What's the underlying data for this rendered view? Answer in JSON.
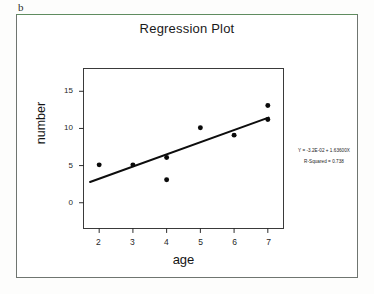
{
  "figure": {
    "panel_letter": "b"
  },
  "chart_data": {
    "type": "scatter",
    "title": "Regression Plot",
    "xlabel": "age",
    "ylabel": "number",
    "x": [
      2,
      3,
      4,
      4,
      5,
      6,
      7,
      7
    ],
    "y": [
      5.1,
      5.1,
      6.1,
      3.1,
      10.1,
      9.1,
      13.1,
      11.2
    ],
    "points": [
      {
        "x": 2,
        "y": 5.1
      },
      {
        "x": 3,
        "y": 5.1
      },
      {
        "x": 4,
        "y": 6.1
      },
      {
        "x": 4,
        "y": 3.1
      },
      {
        "x": 5,
        "y": 10.1
      },
      {
        "x": 6,
        "y": 9.1
      },
      {
        "x": 7,
        "y": 13.1
      },
      {
        "x": 7,
        "y": 11.2
      }
    ],
    "xlim": [
      1.55,
      7.45
    ],
    "ylim": [
      -3.4,
      18.0
    ],
    "xticks": [
      2,
      3,
      4,
      5,
      6,
      7
    ],
    "xtick_labels": [
      "2",
      "3",
      "4",
      "5",
      "6",
      "7"
    ],
    "yticks": [
      0,
      5,
      10,
      15
    ],
    "ytick_labels": [
      "0",
      "5",
      "10",
      "15"
    ],
    "grid": false,
    "legend": "none",
    "fit_line": {
      "intercept": -0.032,
      "slope": 1.636,
      "x_start": 1.73,
      "x_end": 7.02
    },
    "annotations": [
      "Y = -3.2E-02 + 1.63600X",
      "R-Squared = 0.738"
    ],
    "marker_color": "#0a0a0a",
    "line_color": "#0d0d0d"
  }
}
